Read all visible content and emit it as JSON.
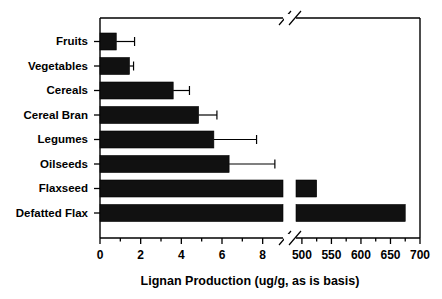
{
  "chart_data": {
    "type": "bar",
    "orientation": "horizontal",
    "title": "",
    "xlabel": "Lignan Production (ug/g, as is basis)",
    "ylabel": "",
    "grid": false,
    "legend": null,
    "axis_break": {
      "present": true,
      "lower_segment_range": [
        0,
        9
      ],
      "upper_segment_range": [
        500,
        700
      ],
      "note": "x-axis is broken between 9 and 500"
    },
    "categories": [
      "Fruits",
      "Vegetables",
      "Cereals",
      "Cereal Bran",
      "Legumes",
      "Oilseeds",
      "Flaxseed",
      "Defatted Flax"
    ],
    "values": [
      0.8,
      1.45,
      3.6,
      4.85,
      5.6,
      6.35,
      525,
      675
    ],
    "errors_upper": [
      1.7,
      1.65,
      4.4,
      5.75,
      7.7,
      8.6,
      null,
      null
    ],
    "xticks_lower": [
      0,
      2,
      4,
      6,
      8
    ],
    "xticks_lower_minor": [
      1,
      3,
      5,
      7
    ],
    "xticks_upper": [
      500,
      550,
      600,
      650,
      700
    ],
    "xtick_labels_lower": [
      "0",
      "2",
      "4",
      "6",
      "8"
    ],
    "xtick_labels_upper": [
      "500",
      "550",
      "600",
      "650",
      "700"
    ],
    "xlim_lower": [
      0,
      9
    ],
    "xlim_upper": [
      490,
      700
    ],
    "bar_color": "#111111",
    "axis_color": "#000000",
    "background_color": "#ffffff"
  },
  "figure": {
    "axis_title": "Lignan Production (ug/g, as is basis)"
  }
}
